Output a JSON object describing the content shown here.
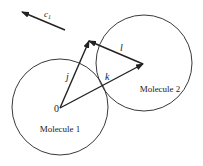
{
  "diagram": {
    "circles": [
      {
        "id": "molecule-1",
        "label": "Molecule 1",
        "cx": 60,
        "cy": 107,
        "r": 48,
        "label_x": 60,
        "label_y": 132
      },
      {
        "id": "molecule-2",
        "label": "Molecule 2",
        "cx": 144,
        "cy": 63,
        "r": 48,
        "label_x": 160,
        "label_y": 92
      }
    ],
    "origin": {
      "label": "0",
      "x": 54,
      "y": 112
    },
    "vectors": [
      {
        "name": "j",
        "label": "j",
        "x1": 60,
        "y1": 108,
        "x2": 89,
        "y2": 41,
        "label_x": 66,
        "label_y": 80
      },
      {
        "name": "k",
        "label": "k",
        "x1": 60,
        "y1": 108,
        "x2": 143,
        "y2": 64,
        "label_x": 105,
        "label_y": 80
      },
      {
        "name": "l",
        "label": "l",
        "x1": 143,
        "y1": 64,
        "x2": 89,
        "y2": 41,
        "label_x": 120,
        "label_y": 51
      }
    ],
    "velocity": {
      "label": "c",
      "subscript": "1",
      "x1": 65,
      "y1": 30,
      "x2": 22,
      "y2": 12,
      "label_x": 44,
      "label_y": 17
    },
    "colors": {
      "stroke": "#222222",
      "background": "#ffffff"
    }
  }
}
